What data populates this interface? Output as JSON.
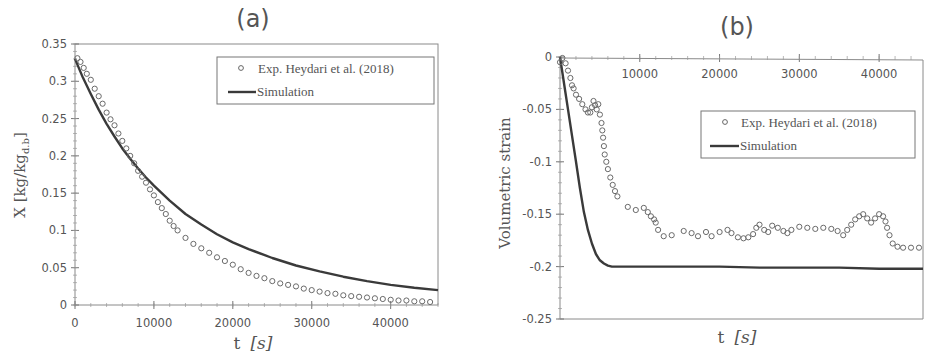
{
  "chart_data": [
    {
      "type": "scatter",
      "panel": "(a)",
      "title": "(a)",
      "xlabel": "t  [s]",
      "ylabel": "X  [kg/kg_d.b]",
      "xlim": [
        0,
        46000
      ],
      "ylim": [
        0,
        0.35
      ],
      "xticks": [
        0,
        10000,
        20000,
        30000,
        40000
      ],
      "yticks": [
        0,
        0.05,
        0.1,
        0.15,
        0.2,
        0.25,
        0.3,
        0.35
      ],
      "xtick_labels": [
        "0",
        "10000",
        "20000",
        "30000",
        "40000"
      ],
      "ytick_labels": [
        "0",
        "0.05",
        "0.1",
        "0.15",
        "0.2",
        "0.25",
        "0.3",
        "0.35"
      ],
      "grid": false,
      "legend_position": "upper right",
      "series": [
        {
          "name": "Exp. Heydari et al. (2018)",
          "style": "open-circle-markers",
          "x": [
            300,
            700,
            1100,
            1500,
            2000,
            2500,
            3000,
            3500,
            4000,
            4500,
            5000,
            5500,
            6000,
            6500,
            7000,
            7500,
            8000,
            8500,
            9000,
            9500,
            10000,
            10500,
            11000,
            11500,
            12000,
            12500,
            13000,
            14000,
            15000,
            16000,
            17000,
            18000,
            19000,
            20000,
            21000,
            22000,
            23000,
            24000,
            25000,
            26000,
            27000,
            28000,
            29000,
            30000,
            31000,
            32000,
            33000,
            34000,
            35000,
            36000,
            37000,
            38000,
            39000,
            40000,
            41000,
            42000,
            43000,
            44000,
            45000
          ],
          "y": [
            0.331,
            0.326,
            0.318,
            0.31,
            0.302,
            0.29,
            0.28,
            0.27,
            0.258,
            0.249,
            0.241,
            0.23,
            0.22,
            0.21,
            0.2,
            0.19,
            0.18,
            0.172,
            0.164,
            0.155,
            0.147,
            0.138,
            0.13,
            0.122,
            0.113,
            0.106,
            0.1,
            0.09,
            0.082,
            0.076,
            0.07,
            0.064,
            0.059,
            0.054,
            0.048,
            0.043,
            0.039,
            0.036,
            0.032,
            0.029,
            0.027,
            0.025,
            0.022,
            0.02,
            0.018,
            0.016,
            0.015,
            0.013,
            0.012,
            0.011,
            0.01,
            0.009,
            0.008,
            0.007,
            0.006,
            0.006,
            0.005,
            0.005,
            0.004
          ]
        },
        {
          "name": "Simulation",
          "style": "solid-line",
          "x": [
            0,
            1000,
            2000,
            3000,
            4000,
            5000,
            6000,
            7000,
            8000,
            9000,
            10000,
            12000,
            14000,
            16000,
            18000,
            20000,
            22000,
            25000,
            28000,
            31000,
            34000,
            37000,
            40000,
            43000,
            46000
          ],
          "y": [
            0.33,
            0.305,
            0.283,
            0.262,
            0.243,
            0.226,
            0.21,
            0.196,
            0.183,
            0.171,
            0.16,
            0.14,
            0.122,
            0.108,
            0.095,
            0.084,
            0.075,
            0.063,
            0.053,
            0.045,
            0.038,
            0.032,
            0.027,
            0.023,
            0.02
          ]
        }
      ]
    },
    {
      "type": "scatter",
      "panel": "(b)",
      "title": "(b)",
      "xlabel": "t  [s]",
      "ylabel": "Volumetric strain",
      "xlim": [
        0,
        45500
      ],
      "ylim": [
        -0.25,
        0
      ],
      "xticks": [
        10000,
        20000,
        30000,
        40000
      ],
      "yticks": [
        0,
        -0.05,
        -0.1,
        -0.15,
        -0.2,
        -0.25
      ],
      "xtick_labels": [
        "10000",
        "20000",
        "30000",
        "40000"
      ],
      "ytick_labels": [
        "0",
        "-0.05",
        "-0.1",
        "-0.15",
        "-0.2",
        "-0.25"
      ],
      "x_axis_position": "top (at y=0)",
      "grid": false,
      "legend_position": "upper right (below axis)",
      "series": [
        {
          "name": "Exp. Heydari et al. (2018)",
          "style": "open-circle-markers",
          "x": [
            0,
            300,
            700,
            1000,
            1300,
            1500,
            1700,
            2000,
            2400,
            2800,
            3200,
            3500,
            3800,
            4000,
            4200,
            4400,
            4600,
            4800,
            5000,
            5200,
            5300,
            5400,
            5500,
            5600,
            5800,
            6000,
            6300,
            6600,
            6900,
            7200,
            8500,
            9500,
            10500,
            11000,
            11400,
            11800,
            12000,
            12300,
            13000,
            14000,
            15500,
            16500,
            17300,
            18300,
            19000,
            20000,
            21000,
            21500,
            22300,
            23000,
            23600,
            24200,
            24600,
            25000,
            25600,
            26100,
            26600,
            27300,
            28000,
            28500,
            29000,
            30000,
            31000,
            32000,
            33000,
            34000,
            34800,
            35500,
            36000,
            36500,
            37000,
            37500,
            38000,
            38500,
            39000,
            39500,
            40000,
            40500,
            40800,
            41000,
            41300,
            41700,
            42300,
            43000,
            44000,
            45000
          ],
          "y": [
            -0.005,
            -0.001,
            -0.006,
            -0.013,
            -0.02,
            -0.027,
            -0.03,
            -0.036,
            -0.04,
            -0.045,
            -0.05,
            -0.053,
            -0.053,
            -0.048,
            -0.042,
            -0.046,
            -0.05,
            -0.045,
            -0.055,
            -0.063,
            -0.07,
            -0.077,
            -0.085,
            -0.093,
            -0.1,
            -0.107,
            -0.115,
            -0.122,
            -0.128,
            -0.133,
            -0.143,
            -0.146,
            -0.144,
            -0.148,
            -0.152,
            -0.155,
            -0.158,
            -0.165,
            -0.171,
            -0.17,
            -0.166,
            -0.168,
            -0.171,
            -0.167,
            -0.171,
            -0.167,
            -0.165,
            -0.168,
            -0.172,
            -0.173,
            -0.172,
            -0.169,
            -0.163,
            -0.16,
            -0.165,
            -0.167,
            -0.161,
            -0.163,
            -0.166,
            -0.168,
            -0.165,
            -0.162,
            -0.163,
            -0.164,
            -0.163,
            -0.164,
            -0.166,
            -0.17,
            -0.165,
            -0.16,
            -0.155,
            -0.152,
            -0.15,
            -0.154,
            -0.158,
            -0.154,
            -0.15,
            -0.152,
            -0.157,
            -0.163,
            -0.17,
            -0.178,
            -0.181,
            -0.182,
            -0.182,
            -0.182
          ]
        },
        {
          "name": "Simulation",
          "style": "solid-line",
          "x": [
            0,
            500,
            1000,
            1500,
            2000,
            2500,
            3000,
            3500,
            4000,
            4500,
            5000,
            5500,
            6000,
            6500,
            7000,
            8000,
            10000,
            15000,
            20000,
            25000,
            30000,
            35000,
            40000,
            45500
          ],
          "y": [
            0,
            -0.025,
            -0.05,
            -0.075,
            -0.1,
            -0.125,
            -0.148,
            -0.165,
            -0.178,
            -0.188,
            -0.194,
            -0.197,
            -0.199,
            -0.2,
            -0.2,
            -0.2,
            -0.2,
            -0.2,
            -0.2,
            -0.201,
            -0.201,
            -0.201,
            -0.202,
            -0.202
          ]
        }
      ]
    }
  ],
  "panels": {
    "a": {
      "title": "(a)",
      "xlabel_var": "t",
      "xlabel_unit": "[s]",
      "ylabel": "X  [kg/kg",
      "ylabel_sub": "d.b",
      "ylabel_close": "]",
      "legend": [
        "Exp. Heydari et al. (2018)",
        "Simulation"
      ]
    },
    "b": {
      "title": "(b)",
      "xlabel_var": "t",
      "xlabel_unit": "[s]",
      "ylabel": "Volumetric strain",
      "legend": [
        "Exp. Heydari et al. (2018)",
        "Simulation"
      ]
    }
  },
  "colors": {
    "ink": "#555555",
    "line": "#3a3a3a",
    "marker": "#6a6a6a",
    "background": "#ffffff"
  }
}
